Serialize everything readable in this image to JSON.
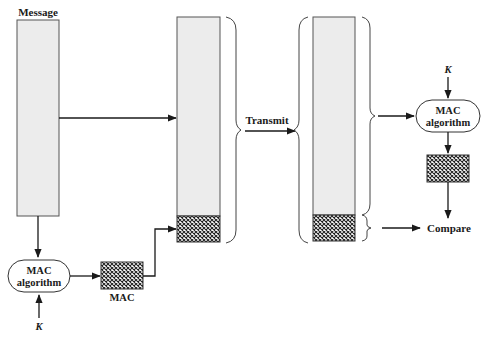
{
  "diagram": {
    "labels": {
      "message": "Message",
      "transmit": "Transmit",
      "compare": "Compare",
      "mac": "MAC",
      "key_left": "K",
      "key_right": "K",
      "mac_algo_left_line1": "MAC",
      "mac_algo_left_line2": "algorithm",
      "mac_algo_right_line1": "MAC",
      "mac_algo_right_line2": "algorithm"
    },
    "colors": {
      "block_fill": "#ececec",
      "stroke": "#333333",
      "hatch": "#222222"
    }
  }
}
